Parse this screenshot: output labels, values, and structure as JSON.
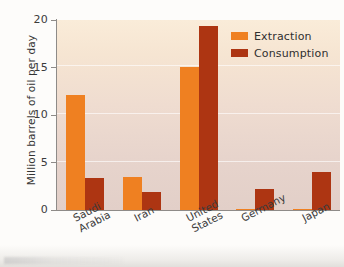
{
  "chart_data": {
    "type": "bar",
    "title": "",
    "xlabel": "",
    "ylabel": "Million barrels of oil per day",
    "ylim": [
      0,
      20
    ],
    "yticks": [
      0,
      5,
      10,
      15,
      20
    ],
    "ytick_labels": [
      "0",
      "5",
      "10",
      "15",
      "20"
    ],
    "grid": true,
    "grid_axis": "y",
    "legend_position": "top-right",
    "categories": [
      "Saudi Arabia",
      "Iran",
      "United States",
      "Germany",
      "Japan"
    ],
    "category_lines": [
      [
        "Saudi",
        "Arabia"
      ],
      [
        "Iran",
        ""
      ],
      [
        "United",
        "States"
      ],
      [
        "Germany",
        ""
      ],
      [
        "Japan",
        ""
      ]
    ],
    "series": [
      {
        "name": "Extraction",
        "color": "#ef8021",
        "values": [
          12.1,
          3.5,
          15.1,
          0.1,
          0.05
        ]
      },
      {
        "name": "Consumption",
        "color": "#ad3512",
        "values": [
          3.4,
          1.9,
          19.4,
          2.2,
          4.0
        ]
      }
    ]
  },
  "legend": {
    "items": [
      {
        "label": "Extraction",
        "swatch": "extraction"
      },
      {
        "label": "Consumption",
        "swatch": "consumption"
      }
    ]
  },
  "colors": {
    "extraction": "#ef8021",
    "consumption": "#ad3512",
    "plot_bg_top": "#faecd9",
    "plot_bg_bottom": "#e2cfc8",
    "axis": "#8e8b88",
    "text": "#3b3b3b"
  }
}
